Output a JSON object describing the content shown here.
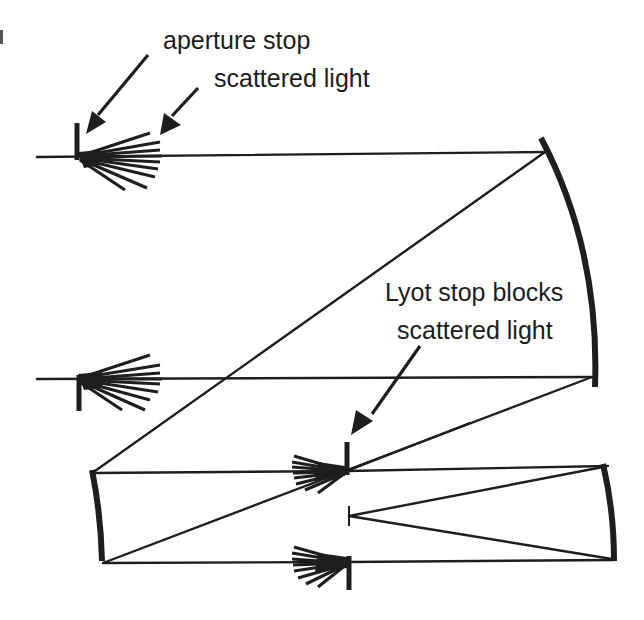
{
  "figure": {
    "type": "optical-schematic"
  },
  "labels": {
    "aperture_stop": "aperture stop",
    "scattered_light_top": "scattered light",
    "lyot_line1": "Lyot stop blocks",
    "lyot_line2": "scattered light"
  },
  "colors": {
    "ink": "#1e1e1e",
    "background": "#ffffff"
  },
  "elements": [
    {
      "name": "aperture-stop-upper",
      "kind": "stop"
    },
    {
      "name": "scatter-fan-upper",
      "kind": "scattered-light"
    },
    {
      "name": "aperture-stop-lower",
      "kind": "stop"
    },
    {
      "name": "scatter-fan-lower",
      "kind": "scattered-light"
    },
    {
      "name": "primary-mirror",
      "kind": "concave-mirror"
    },
    {
      "name": "secondary-mirror",
      "kind": "concave-mirror"
    },
    {
      "name": "lyot-stop-upper",
      "kind": "stop"
    },
    {
      "name": "lyot-stop-lower",
      "kind": "stop"
    },
    {
      "name": "focal-stop",
      "kind": "stop"
    },
    {
      "name": "tertiary-mirror",
      "kind": "concave-mirror"
    }
  ]
}
